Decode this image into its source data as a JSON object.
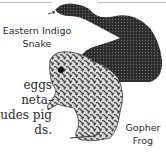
{
  "illustration": {
    "labels": {
      "snake": [
        "Eastern Indigo",
        "Snake"
      ],
      "frog": [
        "Gopher",
        "Frog"
      ]
    },
    "colors": {
      "snake": "#2b2b2b",
      "frog_light": "#d9d9d9",
      "frog_dark": "#3a3a3a"
    }
  },
  "body_text": {
    "lines": [
      "eggs",
      "neta-",
      "udes pig",
      "ds."
    ]
  }
}
